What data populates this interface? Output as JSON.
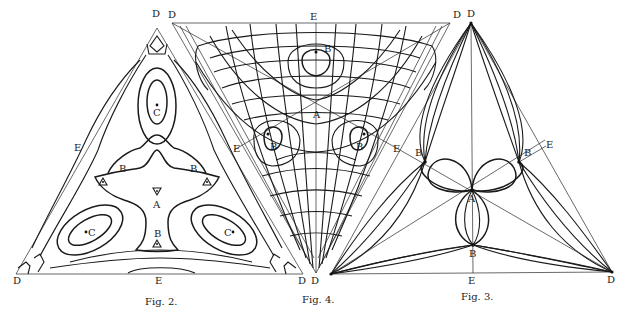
{
  "figures": [
    {
      "id": "fig2",
      "caption": "Fig. 2.",
      "shape": "upward-triangle",
      "vertices": {
        "apex": [
          157,
          28
        ],
        "bottom_left": [
          16,
          274
        ],
        "bottom_right": [
          303,
          274
        ]
      },
      "labels": {
        "apex_D": "D",
        "left_E": "E",
        "right_E": "",
        "bottom_E": "E",
        "bottom_left_D": "D",
        "bottom_right_D": "D",
        "top_C": "C",
        "left_C": "C",
        "right_C": "C",
        "center_A": "A",
        "upper_left_B": "B",
        "upper_right_B": "B",
        "lower_B": "B"
      },
      "description": "Closed contour (level) curves around three maxima C, with saddle points B and center A"
    },
    {
      "id": "fig4",
      "caption": "Fig. 4.",
      "shape": "downward-triangle",
      "vertices": {
        "top_left": [
          172,
          23
        ],
        "top_right": [
          450,
          23
        ],
        "bottom": [
          316,
          273
        ]
      },
      "labels": {
        "top_left_D": "D",
        "top_E": "E",
        "top_right_D": "D",
        "bottom_D": "D",
        "left_E": "E",
        "right_E": "E",
        "center_A": "A",
        "top_B": "B",
        "left_B": "B",
        "right_B": "B"
      },
      "description": "Orthogonal net of curves (lines of force and equipotentials) with singular points B"
    },
    {
      "id": "fig3",
      "caption": "Fig. 3.",
      "shape": "upward-triangle",
      "vertices": {
        "apex": [
          471,
          23
        ],
        "bottom_left": [
          331,
          274
        ],
        "bottom_right": [
          612,
          272
        ]
      },
      "labels": {
        "apex_D": "D",
        "right_E": "E",
        "bottom_E": "E",
        "bottom_right_D": "D",
        "left_B": "B",
        "right_B": "B",
        "bottom_B": "B",
        "center_A": "A"
      },
      "description": "Families of curves through D vertices and loops through B and A"
    }
  ],
  "colors": {
    "ink": "#1a1a1a",
    "paper": "#ffffff"
  }
}
